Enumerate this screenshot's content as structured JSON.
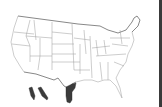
{
  "map": {
    "subject": "Contiguous United States state boundaries with northern Mexico",
    "colors": {
      "background": "#ffffff",
      "state_lines": "#9a9a9a",
      "international_border": "#555555",
      "shaded_region": "#3b3b3b",
      "edge_bar": "#3a3a3a"
    },
    "shaded_regions": [
      {
        "name": "Baja California (north)"
      },
      {
        "name": "Baja California Sur (coastal strip)"
      },
      {
        "name": "Tamaulipas"
      }
    ],
    "legend": []
  }
}
